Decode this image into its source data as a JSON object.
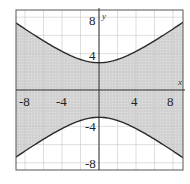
{
  "chart_data": {
    "type": "area",
    "title": "",
    "xlabel": "x",
    "ylabel": "y",
    "xlim": [
      -9,
      9
    ],
    "ylim": [
      -8.8,
      8.8
    ],
    "grid": true,
    "grid_step": 2,
    "x_ticks": [
      {
        "value": -8,
        "label": "-8"
      },
      {
        "value": -4,
        "label": "-4"
      },
      {
        "value": 4,
        "label": "4"
      },
      {
        "value": 8,
        "label": "8"
      }
    ],
    "y_ticks": [
      {
        "value": 8,
        "label": "8"
      },
      {
        "value": 4,
        "label": "4"
      },
      {
        "value": -4,
        "label": "-4"
      },
      {
        "value": -8,
        "label": "-8"
      }
    ],
    "boundary_equation": "y^2/9 - x^2/16 = 1",
    "boundary_style": "solid",
    "series": [
      {
        "name": "upper branch",
        "x": [
          -9,
          -8,
          -6,
          -4,
          -2,
          0,
          2,
          4,
          6,
          8,
          9
        ],
        "y": [
          7.39,
          6.71,
          5.41,
          4.24,
          3.35,
          3.0,
          3.35,
          4.24,
          5.41,
          6.71,
          7.39
        ]
      },
      {
        "name": "lower branch",
        "x": [
          -9,
          -8,
          -6,
          -4,
          -2,
          0,
          2,
          4,
          6,
          8,
          9
        ],
        "y": [
          -7.39,
          -6.71,
          -5.41,
          -4.24,
          -3.35,
          -3.0,
          -3.35,
          -4.24,
          -5.41,
          -6.71,
          -7.39
        ]
      }
    ],
    "shaded_region": "between branches",
    "colors": {
      "shade": "#cfcfcf",
      "curve": "#2a2a2a",
      "grid": "#c8c8c8",
      "axis": "#333333",
      "frame": "#555555"
    }
  },
  "labels": {
    "x_axis": "x",
    "y_axis": "y",
    "xt0": "-8",
    "xt1": "-4",
    "xt2": "4",
    "xt3": "8",
    "yt0": "8",
    "yt1": "4",
    "yt2": "-4",
    "yt3": "-8"
  }
}
